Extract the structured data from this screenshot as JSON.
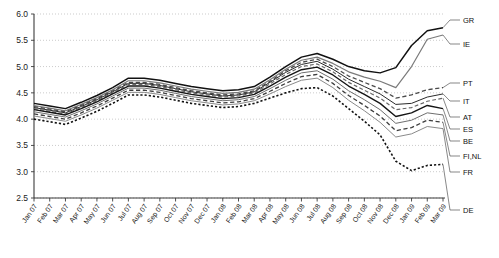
{
  "chart_data": {
    "type": "line",
    "title": "",
    "subtitle": "",
    "xlabel": "",
    "ylabel": "",
    "ylim": [
      2.5,
      6.0
    ],
    "yticks": [
      "2.5",
      "3.0",
      "3.5",
      "4.0",
      "4.5",
      "5.0",
      "5.5",
      "6.0"
    ],
    "grid": true,
    "legend_position": "right-outside",
    "categories": [
      "Jan 07",
      "Feb 07",
      "Mar 07",
      "Apr 07",
      "May 07",
      "Jun 07",
      "Jul 07",
      "Aug 07",
      "Sep 07",
      "Oct 07",
      "Nov 07",
      "Dec 07",
      "Jan 08",
      "Feb 08",
      "Mar 08",
      "Apr 08",
      "May 08",
      "Jun 08",
      "Jul 08",
      "Aug 08",
      "Sep 08",
      "Oct 08",
      "Nov 08",
      "Dec 08",
      "Jan 09",
      "Feb 09",
      "Mar 09"
    ],
    "series": [
      {
        "name": "GR",
        "label": "GR",
        "style": "solid",
        "color": "#111111",
        "width": 1.5,
        "values": [
          4.3,
          4.25,
          4.2,
          4.32,
          4.45,
          4.6,
          4.78,
          4.78,
          4.74,
          4.68,
          4.62,
          4.58,
          4.54,
          4.56,
          4.62,
          4.8,
          5.0,
          5.18,
          5.25,
          5.14,
          5.0,
          4.92,
          4.88,
          4.98,
          5.4,
          5.68,
          5.74
        ]
      },
      {
        "name": "IE",
        "label": "IE",
        "style": "solid",
        "color": "#7a7a7a",
        "width": 1.2,
        "values": [
          4.26,
          4.21,
          4.16,
          4.28,
          4.41,
          4.56,
          4.73,
          4.73,
          4.69,
          4.63,
          4.57,
          4.53,
          4.49,
          4.51,
          4.57,
          4.75,
          4.95,
          5.12,
          5.18,
          5.06,
          4.9,
          4.8,
          4.72,
          4.6,
          5.0,
          5.52,
          5.6
        ]
      },
      {
        "name": "PT",
        "label": "PT",
        "style": "dashed",
        "color": "#4a4a4a",
        "width": 1.3,
        "values": [
          4.24,
          4.19,
          4.14,
          4.26,
          4.39,
          4.54,
          4.7,
          4.7,
          4.66,
          4.6,
          4.54,
          4.5,
          4.46,
          4.48,
          4.54,
          4.72,
          4.92,
          5.08,
          5.14,
          5.0,
          4.82,
          4.7,
          4.58,
          4.4,
          4.46,
          4.56,
          4.6
        ]
      },
      {
        "name": "IT",
        "label": "IT",
        "style": "solid",
        "color": "#2b2b2b",
        "width": 1.0,
        "values": [
          4.22,
          4.17,
          4.12,
          4.24,
          4.37,
          4.52,
          4.68,
          4.68,
          4.64,
          4.58,
          4.52,
          4.48,
          4.44,
          4.46,
          4.52,
          4.7,
          4.89,
          5.04,
          5.1,
          4.95,
          4.76,
          4.62,
          4.48,
          4.28,
          4.3,
          4.42,
          4.48
        ]
      },
      {
        "name": "AT",
        "label": "AT",
        "style": "dashed",
        "color": "#666666",
        "width": 1.2,
        "values": [
          4.2,
          4.15,
          4.1,
          4.22,
          4.35,
          4.5,
          4.66,
          4.66,
          4.62,
          4.56,
          4.5,
          4.46,
          4.42,
          4.44,
          4.5,
          4.67,
          4.85,
          5.0,
          5.05,
          4.9,
          4.7,
          4.55,
          4.4,
          4.18,
          4.22,
          4.34,
          4.4
        ]
      },
      {
        "name": "ES",
        "label": "ES",
        "style": "solid",
        "color": "#151515",
        "width": 1.4,
        "values": [
          4.18,
          4.13,
          4.08,
          4.2,
          4.33,
          4.48,
          4.63,
          4.63,
          4.59,
          4.53,
          4.47,
          4.43,
          4.39,
          4.41,
          4.47,
          4.63,
          4.8,
          4.94,
          4.99,
          4.84,
          4.63,
          4.47,
          4.3,
          4.05,
          4.12,
          4.26,
          4.2
        ]
      },
      {
        "name": "BE",
        "label": "BE",
        "style": "solid",
        "color": "#6e6e6e",
        "width": 1.0,
        "values": [
          4.14,
          4.09,
          4.04,
          4.16,
          4.29,
          4.44,
          4.59,
          4.59,
          4.55,
          4.49,
          4.43,
          4.39,
          4.35,
          4.37,
          4.43,
          4.58,
          4.74,
          4.88,
          4.92,
          4.76,
          4.54,
          4.37,
          4.18,
          3.92,
          3.98,
          4.12,
          4.08
        ]
      },
      {
        "name": "FI,NL",
        "label": "FI,NL",
        "style": "dashed",
        "color": "#3d3d3d",
        "width": 1.3,
        "values": [
          4.1,
          4.05,
          4.0,
          4.12,
          4.25,
          4.4,
          4.55,
          4.55,
          4.51,
          4.45,
          4.39,
          4.35,
          4.31,
          4.33,
          4.39,
          4.53,
          4.68,
          4.81,
          4.85,
          4.68,
          4.45,
          4.26,
          4.06,
          3.78,
          3.84,
          3.98,
          3.94
        ]
      },
      {
        "name": "FR",
        "label": "FR",
        "style": "solid",
        "color": "#8a8a8a",
        "width": 1.0,
        "values": [
          4.06,
          4.01,
          3.96,
          4.08,
          4.21,
          4.36,
          4.51,
          4.51,
          4.47,
          4.41,
          4.35,
          4.31,
          4.27,
          4.29,
          4.35,
          4.48,
          4.62,
          4.74,
          4.78,
          4.6,
          4.36,
          4.16,
          3.94,
          3.66,
          3.72,
          3.86,
          3.82
        ]
      },
      {
        "name": "DE",
        "label": "DE",
        "style": "dotted",
        "color": "#111111",
        "width": 1.6,
        "values": [
          4.0,
          3.95,
          3.9,
          4.02,
          4.15,
          4.3,
          4.46,
          4.46,
          4.42,
          4.36,
          4.3,
          4.26,
          4.22,
          4.24,
          4.3,
          4.4,
          4.5,
          4.58,
          4.6,
          4.44,
          4.2,
          3.96,
          3.7,
          3.2,
          3.02,
          3.12,
          3.14
        ]
      }
    ],
    "legend_entries": [
      "GR",
      "IE",
      "PT",
      "IT",
      "AT",
      "ES",
      "BE",
      "FI,NL",
      "FR",
      "DE"
    ]
  },
  "caption": {
    "text": ""
  }
}
